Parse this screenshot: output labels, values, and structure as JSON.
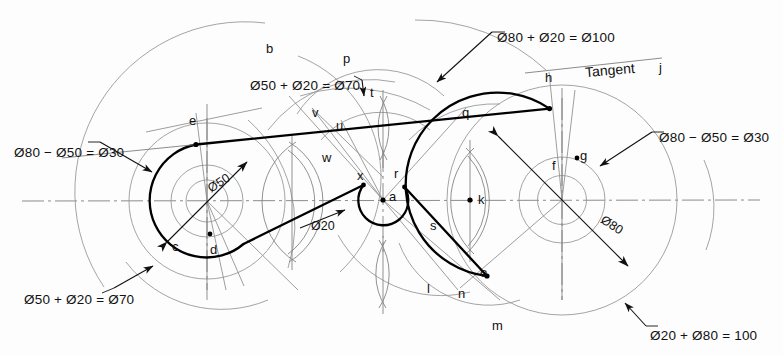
{
  "drawing": {
    "title": "Tangent construction between circles",
    "colors": {
      "outline": "#000000",
      "construction": "#8b8b8b",
      "centerline": "#6f6f6f",
      "background": "#ffffff"
    }
  },
  "dimensions": [
    {
      "id": "left-diff",
      "text": "Ø80 − Ø50 = Ø30",
      "x": 14,
      "y": 145
    },
    {
      "id": "left-sum",
      "text": "Ø50 + Ø20 = Ø70",
      "x": 24,
      "y": 292
    },
    {
      "id": "top-sum-70",
      "text": "Ø50 + Ø20 = Ø70",
      "x": 250,
      "y": 78
    },
    {
      "id": "top-sum-100",
      "text": "Ø80 + Ø20 = Ø100",
      "x": 497,
      "y": 30
    },
    {
      "id": "right-diff",
      "text": "Ø80 − Ø50 = Ø30",
      "x": 659,
      "y": 130
    },
    {
      "id": "bottom-sum-100",
      "text": "Ø20 + Ø80 = 100",
      "x": 650,
      "y": 328
    }
  ],
  "inline_dims": [
    {
      "id": "dia-50",
      "text": "Ø50",
      "x": 207,
      "y": 176,
      "rot": -32
    },
    {
      "id": "dia-20",
      "text": "Ø20",
      "x": 311,
      "y": 219,
      "rot": 0
    },
    {
      "id": "dia-80",
      "text": "Ø80",
      "x": 600,
      "y": 218,
      "rot": 33
    }
  ],
  "tangent_label": {
    "text": "Tangent",
    "x": 585,
    "y": 62
  },
  "points": [
    {
      "id": "a",
      "label": "a",
      "x": 389,
      "y": 189
    },
    {
      "id": "b",
      "label": "b",
      "x": 266,
      "y": 41
    },
    {
      "id": "c",
      "label": "c",
      "x": 172,
      "y": 239
    },
    {
      "id": "d",
      "label": "d",
      "x": 210,
      "y": 242
    },
    {
      "id": "e",
      "label": "e",
      "x": 189,
      "y": 113
    },
    {
      "id": "f",
      "label": "f",
      "x": 552,
      "y": 158
    },
    {
      "id": "g",
      "label": "g",
      "x": 580,
      "y": 148
    },
    {
      "id": "h",
      "label": "h",
      "x": 545,
      "y": 70
    },
    {
      "id": "j",
      "label": "j",
      "x": 659,
      "y": 60
    },
    {
      "id": "k",
      "label": "k",
      "x": 478,
      "y": 192
    },
    {
      "id": "l",
      "label": "l",
      "x": 427,
      "y": 281
    },
    {
      "id": "m",
      "label": "m",
      "x": 492,
      "y": 318
    },
    {
      "id": "n",
      "label": "n",
      "x": 458,
      "y": 286
    },
    {
      "id": "o",
      "label": "o",
      "x": 480,
      "y": 265
    },
    {
      "id": "p",
      "label": "p",
      "x": 343,
      "y": 51
    },
    {
      "id": "q",
      "label": "q",
      "x": 462,
      "y": 105
    },
    {
      "id": "r",
      "label": "r",
      "x": 394,
      "y": 166
    },
    {
      "id": "s",
      "label": "s",
      "x": 430,
      "y": 218
    },
    {
      "id": "t",
      "label": "t",
      "x": 370,
      "y": 85
    },
    {
      "id": "u",
      "label": "u",
      "x": 336,
      "y": 118
    },
    {
      "id": "v",
      "label": "v",
      "x": 312,
      "y": 105
    },
    {
      "id": "w",
      "label": "w",
      "x": 322,
      "y": 150
    },
    {
      "id": "x",
      "label": "x",
      "x": 357,
      "y": 168
    }
  ],
  "geometry": {
    "left_center": {
      "x": 207,
      "y": 201
    },
    "mid_center": {
      "x": 383,
      "y": 200
    },
    "right_center": {
      "x": 562,
      "y": 200
    },
    "left_outer_r": 57,
    "left_inner_r": 36,
    "mid_r": 25,
    "right_outer_r": 92,
    "right_inner_r": 43
  }
}
